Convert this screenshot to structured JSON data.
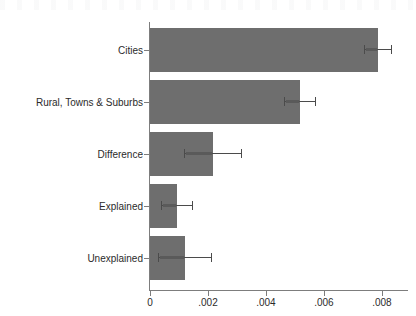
{
  "chart_data": {
    "type": "bar",
    "orientation": "horizontal",
    "title": "",
    "subtitle": "",
    "xlabel": "",
    "ylabel": "",
    "categories": [
      "Cities",
      "Rural, Towns & Suburbs",
      "Difference",
      "Explained",
      "Unexplained"
    ],
    "values": [
      0.00786,
      0.00517,
      0.00217,
      0.00093,
      0.00121
    ],
    "error_high": [
      0.00835,
      0.00572,
      0.00317,
      0.00148,
      0.00214
    ],
    "error_low": [
      0.00737,
      0.00462,
      0.00117,
      0.00038,
      0.00028
    ],
    "xlim": [
      0,
      0.0089
    ],
    "xticks": [
      0,
      0.002,
      0.004,
      0.006,
      0.008
    ],
    "xticklabels": [
      "0",
      ".002",
      ".004",
      ".006",
      ".008"
    ],
    "grid": false,
    "legend": null,
    "bar_color": "#6e6e6e",
    "error_color": "#4b4b4b",
    "axis_color": "#7d7d7d",
    "background": "#ffffff"
  },
  "axes": {
    "y_axis_name": "category-axis",
    "x_axis_name": "value-axis"
  }
}
